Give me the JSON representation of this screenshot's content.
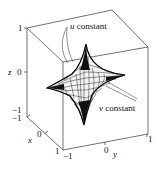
{
  "figure": {
    "type": "3d-surface-plot",
    "surface": "astroidal surface (hypocycloidal sphere)",
    "colors": {
      "background": "#ffffff",
      "lines": "#111111",
      "box": "#333333"
    },
    "axes": {
      "x": {
        "label": "x",
        "ticks": [
          "-1",
          "0",
          "1"
        ]
      },
      "y": {
        "label": "y",
        "ticks": [
          "-1",
          "0",
          "1"
        ]
      },
      "z": {
        "label": "z",
        "ticks": [
          "-1",
          "0",
          "1"
        ]
      }
    },
    "annotations": [
      {
        "id": "u-constant",
        "text": "u constant"
      },
      {
        "id": "v-constant",
        "text": "v constant"
      }
    ]
  },
  "labels": {
    "z_axis": "z",
    "z_tick_top": "1",
    "z_tick_mid": "0",
    "z_tick_bot": "−1",
    "x_axis": "x",
    "x_tick_back": "−1",
    "x_tick_mid": "0",
    "x_tick_front": "1",
    "y_axis": "y",
    "y_tick_left": "−1",
    "y_tick_mid": "0",
    "y_tick_right": "1",
    "u_var": "u",
    "u_rest": " constant",
    "v_var": "v",
    "v_rest": " constant"
  }
}
